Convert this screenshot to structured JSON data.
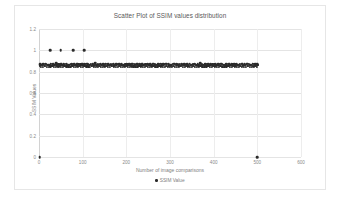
{
  "chart_data": {
    "type": "scatter",
    "title": "Scatter Plot of SSIM values distribution",
    "xlabel": "Number of image comparisons",
    "ylabel": "SSIM Values",
    "xlim": [
      0,
      600
    ],
    "ylim": [
      0,
      1.2
    ],
    "xticks": [
      "0",
      "100",
      "200",
      "300",
      "400",
      "500",
      "600"
    ],
    "xtick_values": [
      0,
      100,
      200,
      300,
      400,
      500,
      600
    ],
    "yticks": [
      "0",
      "0.2",
      "0.4",
      "0.6",
      "0.8",
      "1",
      "1.2"
    ],
    "ytick_values": [
      0,
      0.2,
      0.4,
      0.6,
      0.8,
      1,
      1.2
    ],
    "grid": true,
    "legend_position": "bottom",
    "series": [
      {
        "name": "SSIM Value",
        "color": "#2b2b2b",
        "marker": "circle",
        "points": [
          [
            2,
            0.0
          ],
          [
            500,
            0.0
          ],
          [
            25,
            1.0
          ],
          [
            50,
            1.0
          ],
          [
            78,
            1.0
          ],
          [
            104,
            1.0
          ],
          [
            3,
            0.872
          ],
          [
            9,
            0.868
          ],
          [
            15,
            0.875
          ],
          [
            21,
            0.866
          ],
          [
            27,
            0.874
          ],
          [
            33,
            0.869
          ],
          [
            39,
            0.877
          ],
          [
            45,
            0.864
          ],
          [
            51,
            0.873
          ],
          [
            57,
            0.87
          ],
          [
            63,
            0.876
          ],
          [
            69,
            0.865
          ],
          [
            75,
            0.872
          ],
          [
            81,
            0.868
          ],
          [
            87,
            0.874
          ],
          [
            93,
            0.867
          ],
          [
            99,
            0.875
          ],
          [
            105,
            0.869
          ],
          [
            111,
            0.873
          ],
          [
            117,
            0.866
          ],
          [
            123,
            0.871
          ],
          [
            129,
            0.877
          ],
          [
            135,
            0.864
          ],
          [
            141,
            0.872
          ],
          [
            147,
            0.868
          ],
          [
            153,
            0.875
          ],
          [
            159,
            0.87
          ],
          [
            165,
            0.866
          ],
          [
            171,
            0.874
          ],
          [
            177,
            0.869
          ],
          [
            183,
            0.872
          ],
          [
            189,
            0.876
          ],
          [
            195,
            0.865
          ],
          [
            201,
            0.871
          ],
          [
            207,
            0.868
          ],
          [
            213,
            0.874
          ],
          [
            219,
            0.867
          ],
          [
            225,
            0.873
          ],
          [
            231,
            0.87
          ],
          [
            237,
            0.876
          ],
          [
            243,
            0.864
          ],
          [
            249,
            0.872
          ],
          [
            255,
            0.869
          ],
          [
            261,
            0.875
          ],
          [
            267,
            0.866
          ],
          [
            273,
            0.871
          ],
          [
            279,
            0.874
          ],
          [
            285,
            0.868
          ],
          [
            291,
            0.873
          ],
          [
            297,
            0.87
          ],
          [
            303,
            0.865
          ],
          [
            309,
            0.876
          ],
          [
            315,
            0.872
          ],
          [
            321,
            0.867
          ],
          [
            327,
            0.874
          ],
          [
            333,
            0.869
          ],
          [
            339,
            0.871
          ],
          [
            345,
            0.875
          ],
          [
            351,
            0.866
          ],
          [
            357,
            0.873
          ],
          [
            363,
            0.868
          ],
          [
            369,
            0.877
          ],
          [
            375,
            0.864
          ],
          [
            381,
            0.872
          ],
          [
            387,
            0.87
          ],
          [
            393,
            0.875
          ],
          [
            399,
            0.867
          ],
          [
            405,
            0.873
          ],
          [
            411,
            0.869
          ],
          [
            417,
            0.874
          ],
          [
            423,
            0.866
          ],
          [
            429,
            0.871
          ],
          [
            435,
            0.876
          ],
          [
            441,
            0.868
          ],
          [
            447,
            0.872
          ],
          [
            453,
            0.87
          ],
          [
            459,
            0.865
          ],
          [
            465,
            0.874
          ],
          [
            471,
            0.869
          ],
          [
            477,
            0.873
          ],
          [
            483,
            0.867
          ],
          [
            489,
            0.875
          ],
          [
            495,
            0.871
          ],
          [
            500,
            0.87
          ]
        ],
        "dense_band": {
          "y_center": 0.858,
          "y_spread": 0.012,
          "x_start": 2,
          "x_end": 502,
          "count": 330
        }
      }
    ]
  },
  "legend": {
    "label": "SSIM Value"
  }
}
